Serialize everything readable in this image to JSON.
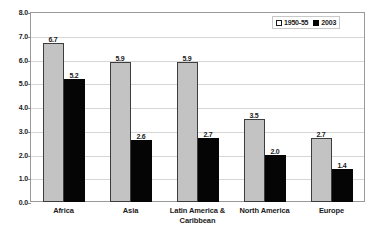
{
  "chart_data": {
    "type": "bar",
    "title": "",
    "xlabel": "",
    "ylabel": "",
    "ylim": [
      0,
      8
    ],
    "ytick_step": 1,
    "yticks": [
      "0.0",
      "1.0",
      "2.0",
      "3.0",
      "4.0",
      "5.0",
      "6.0",
      "7.0",
      "8.0"
    ],
    "grid": true,
    "legend_position": "top-right",
    "categories": [
      "Africa",
      "Asia",
      "Latin America & Caribbean",
      "North America",
      "Europe"
    ],
    "series": [
      {
        "name": "1950-55",
        "color": "#c3c3c3",
        "values": [
          6.7,
          5.9,
          5.9,
          3.5,
          2.7
        ],
        "labels": [
          "6.7",
          "5.9",
          "5.9",
          "3.5",
          "2.7"
        ]
      },
      {
        "name": "2003",
        "color": "#050505",
        "values": [
          5.2,
          2.6,
          2.7,
          2.0,
          1.4
        ],
        "labels": [
          "5.2",
          "2.6",
          "2.7",
          "2.0",
          "1.4"
        ]
      }
    ]
  },
  "category_lines": [
    [
      "Africa"
    ],
    [
      "Asia"
    ],
    [
      "Latin America &",
      "Caribbean"
    ],
    [
      "North America"
    ],
    [
      "Europe"
    ]
  ]
}
